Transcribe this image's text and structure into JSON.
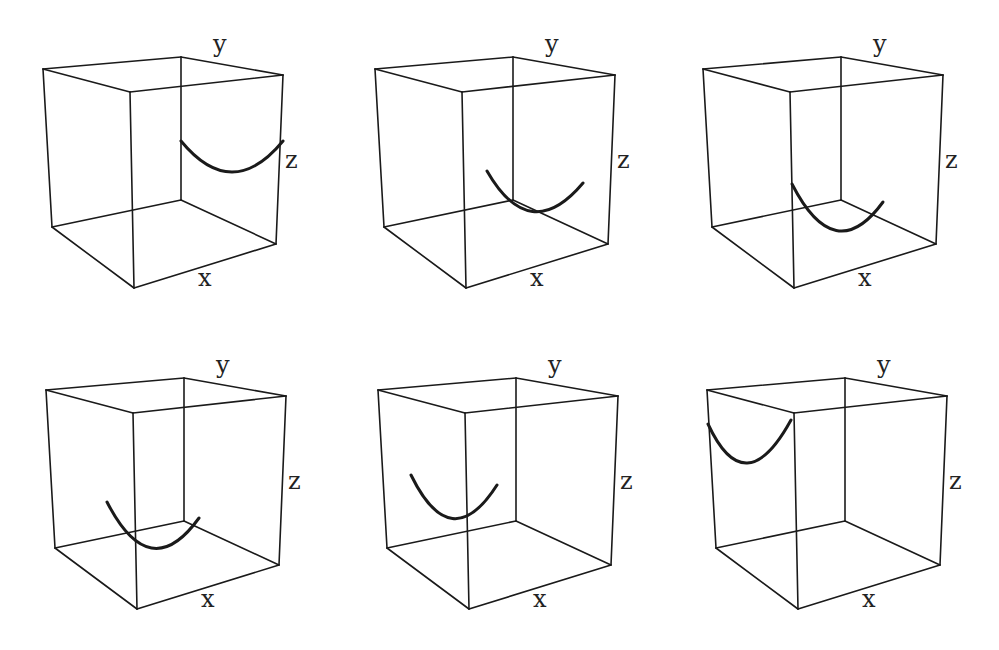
{
  "figure": {
    "axis_labels": {
      "x": "x",
      "y": "y",
      "z": "z"
    },
    "colors": {
      "line": "#1a1a1a",
      "background": "#ffffff"
    }
  },
  "panels": [
    {
      "id": 1,
      "row": 1,
      "col": 1,
      "offset": [
        0,
        0
      ],
      "curve": [
        [
          181,
          141
        ],
        [
          232,
          172
        ],
        [
          283,
          141
        ]
      ]
    },
    {
      "id": 2,
      "row": 1,
      "col": 2,
      "offset": [
        332,
        0
      ],
      "curve": [
        [
          487,
          171
        ],
        [
          538,
          210
        ],
        [
          583,
          183
        ]
      ]
    },
    {
      "id": 3,
      "row": 1,
      "col": 3,
      "offset": [
        660,
        0
      ],
      "curve": [
        [
          792,
          184
        ],
        [
          843,
          227
        ],
        [
          883,
          202
        ]
      ]
    },
    {
      "id": 4,
      "row": 2,
      "col": 1,
      "offset": [
        3,
        321
      ],
      "curve": [
        [
          107,
          502
        ],
        [
          157,
          545
        ],
        [
          199,
          518
        ]
      ]
    },
    {
      "id": 5,
      "row": 2,
      "col": 2,
      "offset": [
        335,
        321
      ],
      "curve": [
        [
          411,
          475
        ],
        [
          458,
          517
        ],
        [
          497,
          485
        ]
      ]
    },
    {
      "id": 6,
      "row": 2,
      "col": 3,
      "offset": [
        664,
        321
      ],
      "curve": [
        [
          708,
          424
        ],
        [
          748,
          462
        ],
        [
          791,
          420
        ]
      ]
    }
  ]
}
